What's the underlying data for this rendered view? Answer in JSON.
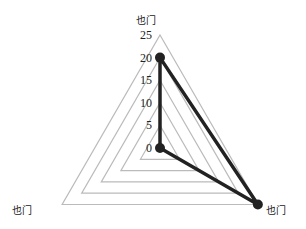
{
  "chart_data": {
    "type": "radar",
    "title": "",
    "categories": [
      "也门",
      "也门",
      "也门"
    ],
    "series": [
      {
        "name": "",
        "values": [
          20,
          25,
          0
        ],
        "color": "#222222"
      }
    ],
    "radial_ticks": [
      "0",
      "5",
      "10",
      "15",
      "20",
      "25"
    ],
    "rlim": [
      0,
      25
    ],
    "grid": true,
    "grid_color": "#bbbbbb",
    "legend": "none"
  }
}
